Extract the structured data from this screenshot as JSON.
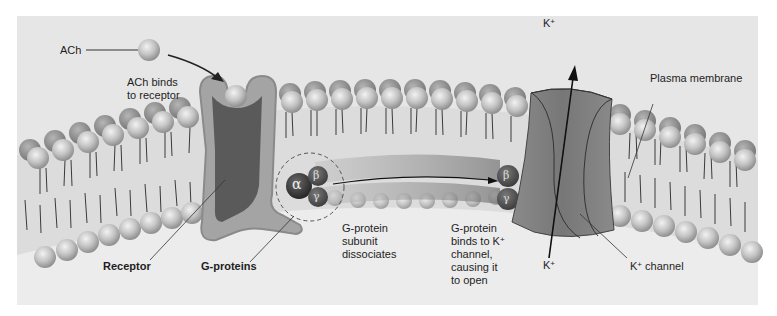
{
  "diagram": {
    "style": "grayscale",
    "colors": {
      "panel_bg": "#e6e6e6",
      "extracellular_bg": "#e9e9e9",
      "membrane_core": "#dadada",
      "head_light": "#d8d8d8",
      "head_dark": "#8a8a8a",
      "receptor_fill": "#5a5a5a",
      "receptor_rim": "#a8a8a8",
      "channel_fill": "#7d7d7d",
      "gprotein_alpha": "#3c3c3c",
      "gprotein_beta_gamma": "#555555",
      "text": "#1e1e1e"
    }
  },
  "labels": {
    "ach": "ACh",
    "ach_binds_line1": "ACh binds",
    "ach_binds_line2": "to receptor",
    "receptor": "Receptor",
    "g_proteins": "G-proteins",
    "subunit_line1": "G-protein",
    "subunit_line2": "subunit",
    "subunit_line3": "dissociates",
    "binds_line1": "G-protein",
    "binds_line2": "binds to K",
    "binds_line3": "channel,",
    "binds_line4": "causing it",
    "binds_line5": "to open",
    "k_ion_top": "K",
    "k_ion_bottom": "K",
    "k_channel": "K",
    "k_channel_suffix": " channel",
    "plus": "+",
    "plasma_membrane": "Plasma membrane"
  },
  "subunits": {
    "alpha": "α",
    "beta": "β",
    "gamma": "γ"
  }
}
